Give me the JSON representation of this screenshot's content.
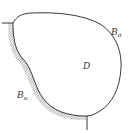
{
  "diagram": {
    "type": "domain-boundary",
    "domain_label": "D",
    "boundaries": [
      {
        "label_main": "B",
        "label_sub": "σ",
        "style": "free curve"
      },
      {
        "label_main": "B",
        "label_sub": "u",
        "style": "hatched (fixed support)"
      }
    ],
    "colors": {
      "stroke": "#222222",
      "hatch": "#555555",
      "background": "#ffffff"
    }
  }
}
